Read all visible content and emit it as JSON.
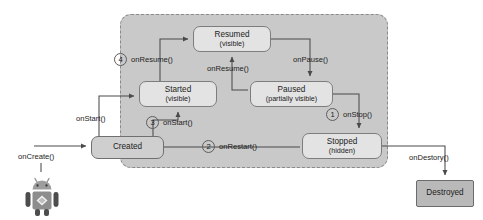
{
  "diagram": {
    "container_label": "visible lifetime region",
    "colors": {
      "region_fill": "#c9c9c9",
      "state_fill": "#e3e3e3",
      "created_fill": "#cfcfcf",
      "destroyed_fill": "#b9b9b9",
      "stroke": "#7d7d7d",
      "text": "#1c1c1c"
    }
  },
  "states": {
    "resumed": {
      "name": "Resumed",
      "sub": "(visible)"
    },
    "started": {
      "name": "Started",
      "sub": "(visible)"
    },
    "paused": {
      "name": "Paused",
      "sub": "(partially visible)"
    },
    "stopped": {
      "name": "Stopped",
      "sub": "(hidden)"
    },
    "created": {
      "name": "Created",
      "sub": ""
    },
    "destroyed": {
      "name": "Destroyed",
      "sub": ""
    }
  },
  "callbacks": {
    "on_create": "onCreate()",
    "on_start_left": "onStart()",
    "on_start_step3": "onStart()",
    "on_restart": "onRestart()",
    "on_resume_step4": "onResume()",
    "on_resume_mid": "onResume()",
    "on_pause": "onPause()",
    "on_stop": "onStop()",
    "on_destroy": "onDestory()"
  },
  "steps": {
    "one": "1",
    "two": "2",
    "three": "3",
    "four": "4"
  },
  "icons": {
    "mascot": "android-robot-icon"
  }
}
